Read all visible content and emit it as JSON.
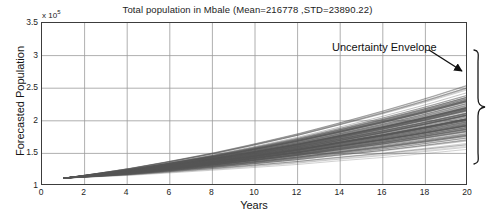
{
  "figure": {
    "title": "Total population in Mbale (Mean=216778 ,STD=23890.22)",
    "exponent_prefix": "x 10",
    "exponent_power": "5",
    "background": "#ffffff",
    "grid_color": "#9a9a9a",
    "axis_color": "#3c3c3c",
    "trace_color": "#555555"
  },
  "annotation": {
    "label": "Uncertainty Envelope",
    "arrow_from_x": 429,
    "arrow_from_y": 50,
    "arrow_to_x": 464,
    "arrow_to_y": 72,
    "brace_name": "curly-brace"
  },
  "chart_data": {
    "type": "line",
    "title": "Total population in Mbale (Mean=216778 ,STD=23890.22)",
    "subtitle": "",
    "xlabel": "Years",
    "ylabel": "Forecasted Population",
    "y_multiplier": 100000,
    "y_multiplier_text": "x 10^5",
    "xlim": [
      0,
      20
    ],
    "ylim": [
      1.0,
      3.5
    ],
    "xticks": [
      0,
      2,
      4,
      6,
      8,
      10,
      12,
      14,
      16,
      18,
      20
    ],
    "xticklabels": [
      "0",
      "2",
      "4",
      "6",
      "8",
      "10",
      "12",
      "14",
      "16",
      "18",
      "20"
    ],
    "yticks": [
      1,
      1.5,
      2,
      2.5,
      3,
      3.5
    ],
    "yticklabels": [
      "1",
      "1.5",
      "2",
      "2.5",
      "3",
      "3.5"
    ],
    "grid": true,
    "legend": "none",
    "n_traces": 200,
    "origin": {
      "x": 1.0,
      "y": 1.12
    },
    "envelope": {
      "x": [
        1,
        2,
        4,
        6,
        8,
        10,
        12,
        14,
        16,
        18,
        20
      ],
      "lower": [
        1.12,
        1.13,
        1.15,
        1.18,
        1.21,
        1.24,
        1.27,
        1.31,
        1.34,
        1.38,
        1.42
      ],
      "upper": [
        1.12,
        1.17,
        1.28,
        1.41,
        1.55,
        1.71,
        1.88,
        2.07,
        2.27,
        2.48,
        2.71
      ],
      "mean": [
        1.12,
        1.15,
        1.21,
        1.29,
        1.37,
        1.46,
        1.56,
        1.66,
        1.78,
        1.9,
        2.03
      ]
    },
    "statistics": {
      "mean": 216778,
      "std": 23890.22
    }
  }
}
